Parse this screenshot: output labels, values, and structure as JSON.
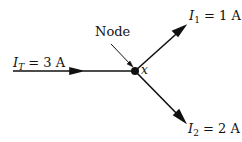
{
  "diagram": {
    "node_label": "Node",
    "node_name": "x",
    "currents": {
      "total": {
        "symbol": "I",
        "subscript": "T",
        "value": "= 3 A"
      },
      "branch1": {
        "symbol": "I",
        "subscript": "1",
        "value": "= 1 A"
      },
      "branch2": {
        "symbol": "I",
        "subscript": "2",
        "value": "= 2 A"
      }
    },
    "colors": {
      "line": "#111111",
      "background": "#ffffff"
    }
  }
}
